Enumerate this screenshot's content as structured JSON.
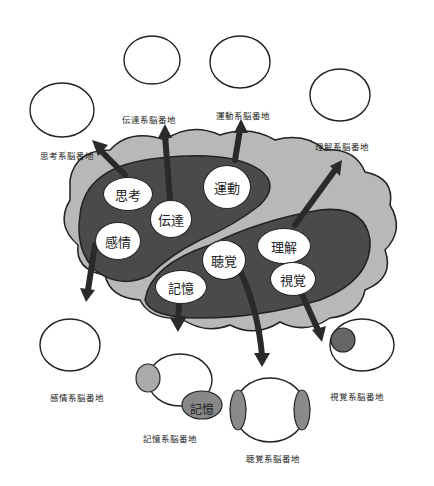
{
  "diagram": {
    "type": "brain-regions-illustration",
    "colors": {
      "brain_outer": "#b8b8b8",
      "lobe_dark": "#4a4a4a",
      "node_fill": "#ffffff",
      "outline": "#222222",
      "arrow": "#2a2a2a"
    },
    "regions": [
      {
        "id": "thinking",
        "label": "思考",
        "caption": "思考系脳番地"
      },
      {
        "id": "transmission",
        "label": "伝達",
        "caption": "伝達系脳番地"
      },
      {
        "id": "motor",
        "label": "運動",
        "caption": "運動系脳番地"
      },
      {
        "id": "understanding",
        "label": "理解",
        "caption": "理解系脳番地"
      },
      {
        "id": "emotion",
        "label": "感情",
        "caption": "感情系脳番地"
      },
      {
        "id": "memory",
        "label": "記憶",
        "caption": "記憶系脳番地"
      },
      {
        "id": "hearing",
        "label": "聴覚",
        "caption": "聴覚系脳番地"
      },
      {
        "id": "vision",
        "label": "視覚",
        "caption": "視覚系脳番地"
      }
    ],
    "memory_bag_label": "記憶"
  }
}
